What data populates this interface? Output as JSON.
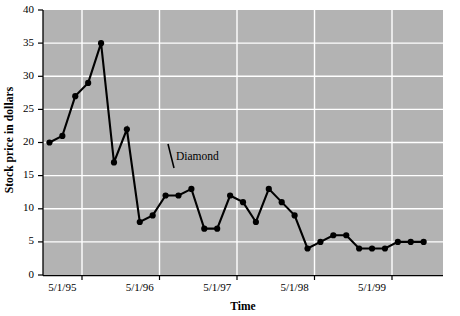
{
  "chart_data": {
    "type": "line",
    "title": "",
    "subtitle": "",
    "xlabel": "Time",
    "ylabel": "Stock price in dollars",
    "ylim": [
      0,
      40
    ],
    "ytick_step": 5,
    "yticks": [
      "0",
      "5",
      "10",
      "15",
      "20",
      "25",
      "30",
      "35",
      "40"
    ],
    "xticks": [
      "5/1/95",
      "5/1/96",
      "5/1/97",
      "5/1/98",
      "5/1/99"
    ],
    "xtick_positions_months": [
      3,
      15,
      27,
      39,
      51
    ],
    "xlim_months": [
      0,
      62
    ],
    "grid": true,
    "legend": false,
    "annotations": [
      {
        "text": "Diamond",
        "x_month": 20,
        "y_value": 17.5
      }
    ],
    "series": [
      {
        "name": "Diamond",
        "marker": "circle",
        "color": "#000000",
        "x": [
          1,
          3,
          5,
          7,
          9,
          11,
          13,
          15,
          17,
          19,
          21,
          23,
          25,
          27,
          29,
          31,
          33,
          35,
          37,
          39,
          41,
          43,
          45,
          47,
          49,
          51,
          53,
          55,
          57,
          59
        ],
        "x_labels": [
          "3/1/95",
          "5/1/95",
          "7/1/95",
          "9/1/95",
          "11/1/95",
          "1/1/96",
          "3/1/96",
          "5/1/96",
          "7/1/96",
          "9/1/96",
          "11/1/96",
          "1/1/97",
          "3/1/97",
          "5/1/97",
          "7/1/97",
          "9/1/97",
          "11/1/97",
          "1/1/98",
          "3/1/98",
          "5/1/98",
          "7/1/98",
          "9/1/98",
          "11/1/98",
          "1/1/99",
          "3/1/99",
          "5/1/99",
          "7/1/99",
          "9/1/99",
          "11/1/99",
          "1/1/00"
        ],
        "values": [
          20,
          21,
          27,
          29,
          35,
          17,
          22,
          8,
          9,
          12,
          12,
          13,
          7,
          7,
          12,
          11,
          8,
          13,
          11,
          9,
          4,
          5,
          6,
          6,
          4,
          4,
          4,
          5,
          5,
          5
        ]
      }
    ]
  },
  "plot_style": {
    "plot_background_color": "#b3b3b3",
    "gridline_color": "#ffffff",
    "axis_color": "#000000",
    "page_background_color": "#ffffff"
  }
}
